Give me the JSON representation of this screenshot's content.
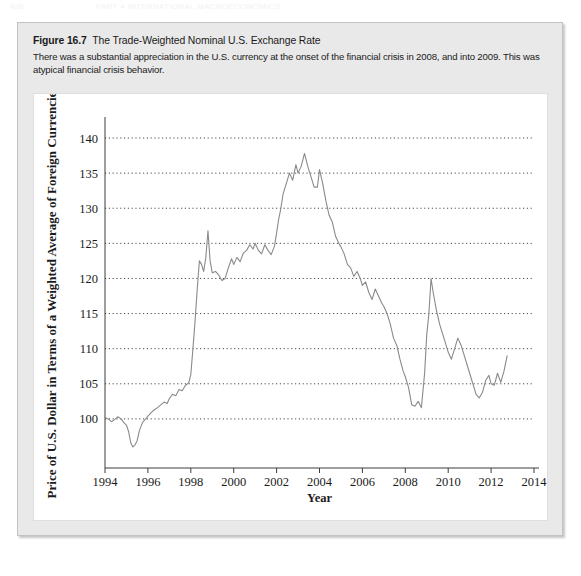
{
  "page_header": {
    "page_number": "426",
    "running_title": "PART 4  INTERNATIONAL MACROECONOMICS"
  },
  "figure": {
    "label": "Figure 16.7",
    "title": "The Trade-Weighted Nominal U.S. Exchange Rate",
    "description": "There was a substantial appreciation in the U.S. currency at the onset of the financial crisis in 2008, and into 2009. This was atypical financial crisis behavior."
  },
  "chart_data": {
    "type": "line",
    "title": "",
    "xlabel": "Year",
    "ylabel": "Price of U.S. Dollar in Terms of a Weighted Average of Foreign Currencies",
    "xlim": [
      1994,
      2014
    ],
    "ylim": [
      95,
      141
    ],
    "xticks": [
      1994,
      1996,
      1998,
      2000,
      2002,
      2004,
      2006,
      2008,
      2010,
      2012,
      2014
    ],
    "yticks": [
      100,
      105,
      110,
      115,
      120,
      125,
      130,
      135,
      140
    ],
    "grid": "horizontal-dotted",
    "legend": "none",
    "line_color": "#8a8a8a",
    "series": [
      {
        "name": "Trade-Weighted Nominal U.S. Exchange Rate",
        "x": [
          1994.0,
          1994.15,
          1994.3,
          1994.45,
          1994.6,
          1994.75,
          1994.9,
          1995.0,
          1995.1,
          1995.2,
          1995.3,
          1995.4,
          1995.5,
          1995.6,
          1995.75,
          1995.9,
          1996.0,
          1996.15,
          1996.3,
          1996.45,
          1996.6,
          1996.75,
          1996.9,
          1997.0,
          1997.15,
          1997.3,
          1997.45,
          1997.6,
          1997.75,
          1997.9,
          1998.0,
          1998.1,
          1998.2,
          1998.3,
          1998.4,
          1998.5,
          1998.6,
          1998.7,
          1998.8,
          1998.9,
          1999.0,
          1999.15,
          1999.3,
          1999.45,
          1999.6,
          1999.75,
          1999.9,
          2000.0,
          2000.15,
          2000.3,
          2000.45,
          2000.6,
          2000.75,
          2000.9,
          2001.0,
          2001.15,
          2001.3,
          2001.45,
          2001.6,
          2001.75,
          2001.9,
          2002.0,
          2002.1,
          2002.2,
          2002.3,
          2002.45,
          2002.6,
          2002.75,
          2002.9,
          2003.0,
          2003.15,
          2003.3,
          2003.45,
          2003.6,
          2003.75,
          2003.9,
          2004.0,
          2004.15,
          2004.3,
          2004.45,
          2004.6,
          2004.75,
          2004.9,
          2005.0,
          2005.15,
          2005.3,
          2005.45,
          2005.6,
          2005.75,
          2005.9,
          2006.0,
          2006.15,
          2006.3,
          2006.45,
          2006.6,
          2006.75,
          2006.9,
          2007.0,
          2007.15,
          2007.3,
          2007.45,
          2007.6,
          2007.75,
          2007.9,
          2008.0,
          2008.15,
          2008.3,
          2008.45,
          2008.6,
          2008.75,
          2008.9,
          2009.0,
          2009.1,
          2009.2,
          2009.3,
          2009.45,
          2009.6,
          2009.75,
          2009.9,
          2010.0,
          2010.15,
          2010.3,
          2010.45,
          2010.6,
          2010.75,
          2010.9,
          2011.0,
          2011.15,
          2011.3,
          2011.45,
          2011.6,
          2011.75,
          2011.9,
          2012.0,
          2012.15,
          2012.3,
          2012.45,
          2012.6,
          2012.75
        ],
        "y": [
          100.2,
          100.0,
          99.6,
          99.9,
          100.3,
          100.0,
          99.4,
          99.1,
          98.2,
          96.6,
          96.0,
          96.3,
          96.9,
          98.3,
          99.5,
          100.0,
          100.4,
          100.9,
          101.3,
          101.6,
          102.0,
          102.4,
          102.2,
          102.9,
          103.5,
          103.3,
          104.2,
          104.0,
          104.8,
          105.1,
          106.3,
          110.0,
          114.0,
          118.5,
          122.5,
          122.0,
          121.0,
          123.0,
          126.8,
          122.5,
          120.8,
          121.0,
          120.5,
          119.7,
          120.0,
          121.5,
          122.8,
          122.0,
          123.0,
          122.4,
          123.6,
          124.0,
          124.8,
          124.2,
          125.0,
          124.0,
          123.5,
          124.8,
          124.0,
          123.4,
          124.6,
          126.5,
          128.5,
          130.0,
          132.0,
          133.5,
          135.0,
          134.0,
          136.2,
          135.0,
          136.0,
          137.8,
          136.0,
          134.5,
          133.0,
          133.0,
          135.5,
          133.5,
          131.0,
          129.0,
          128.0,
          126.0,
          125.0,
          124.5,
          123.5,
          122.0,
          121.5,
          120.3,
          121.0,
          120.0,
          119.0,
          119.5,
          118.0,
          117.0,
          118.5,
          117.5,
          116.5,
          116.0,
          115.0,
          113.5,
          111.5,
          110.5,
          108.5,
          106.8,
          106.0,
          104.5,
          102.0,
          101.8,
          102.5,
          101.6,
          106.5,
          112.0,
          115.0,
          120.0,
          118.0,
          115.5,
          113.5,
          112.0,
          110.5,
          109.5,
          108.5,
          110.0,
          111.5,
          110.5,
          109.0,
          107.5,
          106.5,
          105.0,
          103.5,
          103.0,
          103.8,
          105.5,
          106.2,
          105.0,
          104.8,
          106.5,
          105.2,
          106.8,
          109.0
        ]
      }
    ]
  }
}
